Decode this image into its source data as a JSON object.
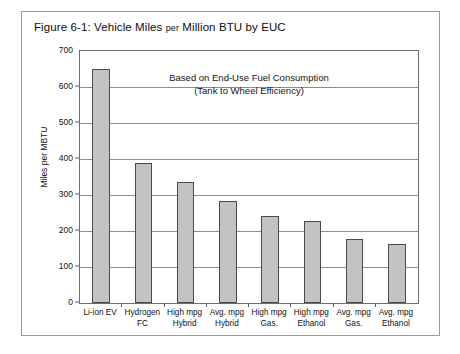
{
  "figure": {
    "title_prefix": "Figure 6-1:  Vehicle Miles ",
    "title_per": "per",
    "title_suffix": " Million BTU by EUC"
  },
  "chart_data": {
    "type": "bar",
    "title": "Figure 6-1:  Vehicle Miles per Million BTU by EUC",
    "xlabel": "",
    "ylabel": "Miles per MBTU",
    "ylim": [
      0,
      700
    ],
    "yticks": [
      0,
      100,
      200,
      300,
      400,
      500,
      600,
      700
    ],
    "ytick_labels": [
      "0",
      "100",
      "200",
      "300",
      "400",
      "500",
      "600",
      "700"
    ],
    "grid": true,
    "legend": "none",
    "annotation_line1": "Based on End-Use Fuel Consumption",
    "annotation_line2": "(Tank to Wheel Efficiency)",
    "bar_color": "#c3c3c3",
    "bar_edge_color": "#4a4a4a",
    "categories": [
      "Li-ion EV",
      "Hydrogen\nFC",
      "High mpg\nHybrid",
      "Avg. mpg\nHybrid",
      "High mpg\nGas.",
      "High mpg\nEthanol",
      "Avg. mpg\nGas.",
      "Avg. mpg\nEthanol"
    ],
    "category_lines": [
      [
        "Li-ion EV",
        ""
      ],
      [
        "Hydrogen",
        "FC"
      ],
      [
        "High mpg",
        "Hybrid"
      ],
      [
        "Avg. mpg",
        "Hybrid"
      ],
      [
        "High mpg",
        "Gas."
      ],
      [
        "High mpg",
        "Ethanol"
      ],
      [
        "Avg. mpg",
        "Gas."
      ],
      [
        "Avg. mpg",
        "Ethanol"
      ]
    ],
    "values": [
      650,
      388,
      337,
      282,
      242,
      227,
      178,
      164
    ]
  }
}
